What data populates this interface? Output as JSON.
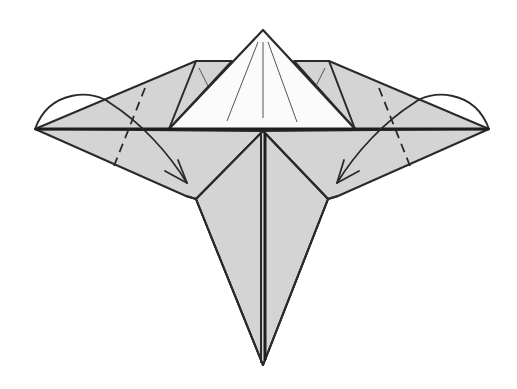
{
  "diagram": {
    "type": "origami-fold-step",
    "colors": {
      "paper_colored_side": "#d4d4d4",
      "paper_white_side": "#fbfbfb",
      "line": "#2a2a2a",
      "background": "#ffffff"
    },
    "elements": {
      "white_flap": "top-pyramid-flap",
      "left_wing": "left-wing-flap",
      "right_wing": "right-wing-flap",
      "lower_body": "lower-point-body",
      "left_fold": "valley-fold-left",
      "right_fold": "valley-fold-right",
      "left_arrow": "fold-arrow-left",
      "right_arrow": "fold-arrow-right"
    },
    "caption": ""
  }
}
